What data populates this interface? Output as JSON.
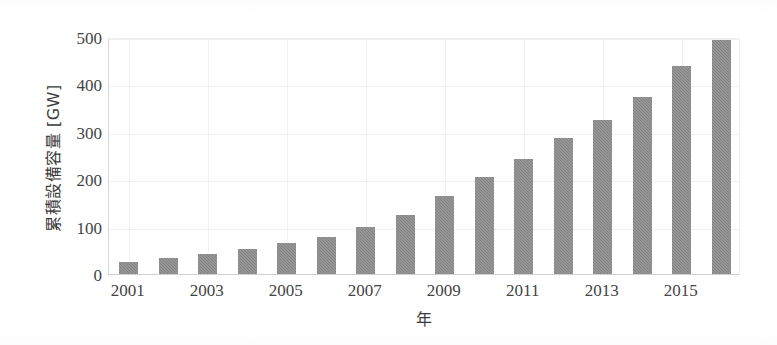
{
  "chart_data": {
    "type": "bar",
    "title": "",
    "xlabel": "年",
    "ylabel": "累積設備容量 [GW]",
    "categories": [
      "2001",
      "2002",
      "2003",
      "2004",
      "2005",
      "2006",
      "2007",
      "2008",
      "2009",
      "2010",
      "2011",
      "2012",
      "2013",
      "2014",
      "2015",
      "2016"
    ],
    "values": [
      25,
      34,
      43,
      53,
      65,
      79,
      99,
      125,
      165,
      205,
      243,
      288,
      324,
      373,
      438,
      493
    ],
    "xtick_labels": [
      "2001",
      "2003",
      "2005",
      "2007",
      "2009",
      "2011",
      "2013",
      "2015"
    ],
    "xtick_values": [
      2001,
      2003,
      2005,
      2007,
      2009,
      2011,
      2013,
      2015
    ],
    "ytick_labels": [
      "0",
      "100",
      "200",
      "300",
      "400",
      "500"
    ],
    "ytick_values": [
      0,
      100,
      200,
      300,
      400,
      500
    ],
    "ylim": [
      0,
      500
    ],
    "xlim": [
      2000.5,
      2016.5
    ],
    "grid": true,
    "legend": null,
    "bar_color": "#828282",
    "axis_color": "#d0d0d0",
    "grid_color": "#f0f0f0",
    "text_color": "#444444"
  }
}
